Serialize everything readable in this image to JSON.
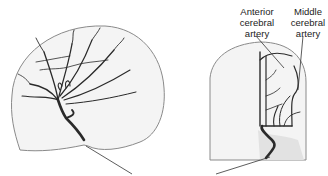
{
  "figure": {
    "panels": [
      {
        "name": "lateral-view",
        "description": "Lateral angiogram of brain vasculature"
      },
      {
        "name": "frontal-view",
        "description": "Frontal angiogram of brain vasculature"
      }
    ],
    "labels": {
      "anterior_cerebral_artery": "Anterior\ncerebral\nartery",
      "anterior_line1": "Anterior",
      "anterior_line2": "cerebral",
      "anterior_line3": "artery",
      "middle_line1": "Middle",
      "middle_line2": "cerebral",
      "middle_line3": "artery"
    },
    "colors": {
      "vessel": "#2a2a2a",
      "skull_outline": "#8a8a8a",
      "skull_fill": "#f4f4f4",
      "leader_line": "#333333"
    }
  }
}
